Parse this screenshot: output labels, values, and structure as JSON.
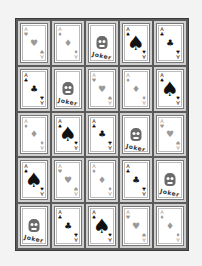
{
  "game": {
    "type": "card-grid",
    "rows": 5,
    "cols": 5,
    "grid": [
      [
        {
          "rank": "A",
          "suit": "heart",
          "glyph": "♥",
          "tone": "light",
          "size": "small"
        },
        {
          "rank": "A",
          "suit": "diamond",
          "glyph": "♦",
          "tone": "light",
          "size": "small"
        },
        {
          "joker": true,
          "label": "Joker"
        },
        {
          "rank": "A",
          "suit": "spade",
          "glyph": "♠",
          "tone": "dark",
          "size": "big"
        },
        {
          "rank": "A",
          "suit": "club",
          "glyph": "♣",
          "tone": "dark",
          "size": "small"
        }
      ],
      [
        {
          "rank": "A",
          "suit": "club",
          "glyph": "♣",
          "tone": "dark",
          "size": "small"
        },
        {
          "joker": true,
          "label": "Joker"
        },
        {
          "rank": "A",
          "suit": "heart",
          "glyph": "♥",
          "tone": "light",
          "size": "small"
        },
        {
          "rank": "A",
          "suit": "diamond",
          "glyph": "♦",
          "tone": "light",
          "size": "small"
        },
        {
          "rank": "A",
          "suit": "spade",
          "glyph": "♠",
          "tone": "dark",
          "size": "big"
        }
      ],
      [
        {
          "rank": "A",
          "suit": "diamond",
          "glyph": "♦",
          "tone": "light",
          "size": "small"
        },
        {
          "rank": "A",
          "suit": "spade",
          "glyph": "♠",
          "tone": "dark",
          "size": "big"
        },
        {
          "rank": "A",
          "suit": "club",
          "glyph": "♣",
          "tone": "dark",
          "size": "small"
        },
        {
          "joker": true,
          "label": "Joker"
        },
        {
          "rank": "A",
          "suit": "heart",
          "glyph": "♥",
          "tone": "light",
          "size": "small"
        }
      ],
      [
        {
          "rank": "A",
          "suit": "spade",
          "glyph": "♠",
          "tone": "dark",
          "size": "big"
        },
        {
          "rank": "A",
          "suit": "heart",
          "glyph": "♥",
          "tone": "light",
          "size": "small"
        },
        {
          "rank": "A",
          "suit": "diamond",
          "glyph": "♦",
          "tone": "light",
          "size": "small"
        },
        {
          "rank": "A",
          "suit": "club",
          "glyph": "♣",
          "tone": "dark",
          "size": "small"
        },
        {
          "joker": true,
          "label": "Joker"
        }
      ],
      [
        {
          "joker": true,
          "label": "Joker"
        },
        {
          "rank": "A",
          "suit": "club",
          "glyph": "♣",
          "tone": "dark",
          "size": "small"
        },
        {
          "rank": "A",
          "suit": "spade",
          "glyph": "♠",
          "tone": "dark",
          "size": "big"
        },
        {
          "rank": "A",
          "suit": "heart",
          "glyph": "♥",
          "tone": "light",
          "size": "small"
        },
        {
          "rank": "A",
          "suit": "diamond",
          "glyph": "♦",
          "tone": "light",
          "size": "small"
        }
      ]
    ]
  },
  "colors": {
    "background": "#f3f3f3",
    "board": "#5a5a5a",
    "cell": "#cfcfcf",
    "card": "#ffffff",
    "light_suit": "#9a9a9a",
    "dark_suit": "#111111"
  }
}
